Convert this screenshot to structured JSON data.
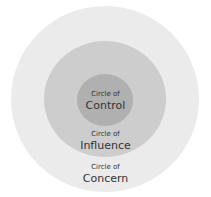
{
  "diagram": {
    "circles": [
      {
        "id": "control",
        "label_top": "Circle of",
        "label_main": "Control",
        "color": "#b0b0b0"
      },
      {
        "id": "influence",
        "label_top": "Circle of",
        "label_main": "Influence",
        "color": "#cdcdcd"
      },
      {
        "id": "concern",
        "label_top": "Circle of",
        "label_main": "Concern",
        "color": "#ebebeb"
      }
    ]
  }
}
